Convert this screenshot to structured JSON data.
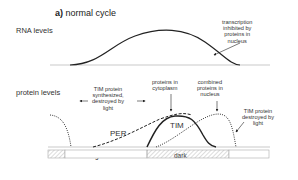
{
  "title": {
    "prefix": "a)",
    "text": "normal cycle"
  },
  "panels": {
    "rna": {
      "label": "RNA levels"
    },
    "protein": {
      "label": "protein levels"
    }
  },
  "annotations": {
    "transcription": [
      "transcription",
      "inhibited by",
      "proteins in",
      "nucleus"
    ],
    "tim_synth": [
      "TIM protein",
      "synthesized,",
      "destroyed by",
      "light"
    ],
    "cytoplasm": [
      "proteins in",
      "cytoplasm"
    ],
    "nucleus": [
      "combined",
      "proteins in",
      "nucleus"
    ],
    "tim_destroyed": [
      "TIM protein",
      "destroyed by",
      "light"
    ]
  },
  "curve_labels": {
    "per": "PER",
    "tim": "TIM"
  },
  "timeline": {
    "light": "light",
    "dark": "dark"
  },
  "colors": {
    "line": "#222222",
    "baseline": "#bbbbbb",
    "hatch": "#999999"
  }
}
